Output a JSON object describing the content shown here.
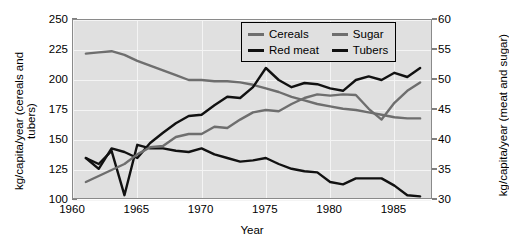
{
  "chart_data": {
    "type": "line",
    "title": "",
    "xlabel": "Year",
    "ylabel": "kg/capita/year (cereals and tubers)",
    "ylabel_right": "kg/capita/year (meat and sugar)",
    "xlim": [
      1960,
      1988
    ],
    "ylim": [
      100,
      250
    ],
    "ylim_right": [
      30,
      60
    ],
    "xticks": [
      1960,
      1965,
      1970,
      1975,
      1980,
      1985
    ],
    "yticks": [
      100,
      125,
      150,
      175,
      200,
      225,
      250
    ],
    "yticks_right": [
      30,
      35,
      40,
      45,
      50,
      55,
      60
    ],
    "grid": true,
    "legend_position": "top-right",
    "plot_background": "#e0e0e0",
    "x": [
      1961,
      1962,
      1963,
      1964,
      1965,
      1966,
      1967,
      1968,
      1969,
      1970,
      1971,
      1972,
      1973,
      1974,
      1975,
      1976,
      1977,
      1978,
      1979,
      1980,
      1981,
      1982,
      1983,
      1984,
      1985,
      1986,
      1987
    ],
    "series": [
      {
        "name": "Cereals",
        "axis": "left",
        "color": "#6e6e6e",
        "values": [
          222,
          223,
          224,
          221,
          216,
          212,
          208,
          204,
          200,
          200,
          199,
          199,
          198,
          196,
          193,
          190,
          186,
          183,
          180,
          178,
          176,
          175,
          173,
          171,
          169,
          168,
          168
        ]
      },
      {
        "name": "Tubers",
        "axis": "left",
        "color": "#111111",
        "values": [
          135,
          130,
          141,
          104,
          146,
          143,
          143,
          141,
          140,
          143,
          138,
          135,
          132,
          133,
          135,
          130,
          126,
          124,
          123,
          115,
          113,
          118,
          118,
          118,
          112,
          104,
          103
        ]
      },
      {
        "name": "Red meat",
        "axis": "right",
        "color": "#111111",
        "values": [
          37.0,
          35.2,
          38.6,
          38.0,
          37.0,
          39.5,
          41.2,
          42.8,
          44.0,
          44.2,
          45.8,
          47.2,
          47.0,
          48.8,
          52.0,
          50.0,
          48.8,
          49.5,
          49.3,
          48.6,
          48.2,
          50.0,
          50.6,
          50.0,
          51.2,
          50.5,
          52.0
        ]
      },
      {
        "name": "Sugar",
        "axis": "right",
        "color": "#6e6e6e",
        "values": [
          33.0,
          34.0,
          35.0,
          36.0,
          37.6,
          38.8,
          39.0,
          40.5,
          41.0,
          41.0,
          42.2,
          42.0,
          43.4,
          44.6,
          45.0,
          44.8,
          46.0,
          47.0,
          47.6,
          47.4,
          47.6,
          47.5,
          45.2,
          43.4,
          46.2,
          48.2,
          49.6
        ]
      }
    ]
  },
  "legend": {
    "items": [
      {
        "label": "Cereals",
        "color": "#6e6e6e"
      },
      {
        "label": "Sugar",
        "color": "#6e6e6e"
      },
      {
        "label": "Red meat",
        "color": "#111111"
      },
      {
        "label": "Tubers",
        "color": "#111111"
      }
    ]
  },
  "axes": {
    "x_label": "Year",
    "y_left_label": "kg/capita/year (cereals and tubers)",
    "y_right_label": "kg/capita/year (meat and sugar)",
    "x_ticks": [
      "1960",
      "1965",
      "1970",
      "1975",
      "1980",
      "1985"
    ],
    "y_left_ticks": [
      "250",
      "225",
      "200",
      "175",
      "150",
      "125",
      "100"
    ],
    "y_right_ticks": [
      "60",
      "55",
      "50",
      "45",
      "40",
      "35",
      "30"
    ]
  }
}
